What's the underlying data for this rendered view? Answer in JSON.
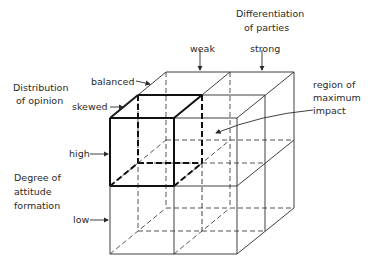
{
  "diagram": {
    "axes": {
      "x": {
        "title_line1": "Differentiation",
        "title_line2": "of parties",
        "levels": [
          "weak",
          "strong"
        ]
      },
      "z": {
        "title_line1": "Distribution",
        "title_line2": "of opinion",
        "levels": [
          "balanced",
          "skewed"
        ]
      },
      "y": {
        "title_line1": "Degree of",
        "title_line2": "attitude",
        "title_line3": "formation",
        "levels": [
          "high",
          "low"
        ]
      }
    },
    "annotation": {
      "line1": "region of",
      "line2": "maximum",
      "line3": "impact"
    },
    "colors": {
      "line": "#2a2a2a",
      "highlight": "#111111",
      "background": "#ffffff"
    }
  }
}
